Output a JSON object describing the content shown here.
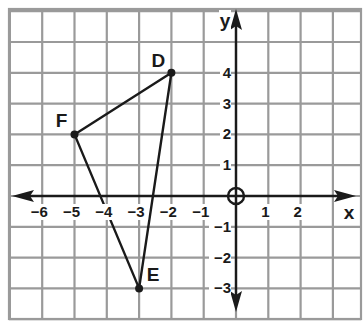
{
  "diagram": {
    "type": "coordinate-plane",
    "axes": {
      "x_label": "x",
      "y_label": "y",
      "x_ticks": [
        {
          "value": -6,
          "label": "−6"
        },
        {
          "value": -5,
          "label": "−5"
        },
        {
          "value": -4,
          "label": "−4"
        },
        {
          "value": -3,
          "label": "−3"
        },
        {
          "value": -2,
          "label": "−2"
        },
        {
          "value": -1,
          "label": "−1"
        },
        {
          "value": 1,
          "label": "1"
        },
        {
          "value": 2,
          "label": "2"
        }
      ],
      "y_ticks": [
        {
          "value": 4,
          "label": "4"
        },
        {
          "value": 3,
          "label": "3"
        },
        {
          "value": 2,
          "label": "2"
        },
        {
          "value": 1,
          "label": "1"
        },
        {
          "value": -1,
          "label": "−1"
        },
        {
          "value": -2,
          "label": "−2"
        },
        {
          "value": -3,
          "label": "−3"
        }
      ],
      "origin_marker": "circle"
    },
    "triangle": {
      "points": [
        {
          "name": "D",
          "x": -2,
          "y": 4
        },
        {
          "name": "E",
          "x": -3,
          "y": -3
        },
        {
          "name": "F",
          "x": -5,
          "y": 2
        }
      ]
    },
    "colors": {
      "grid": "#9a9a9a",
      "axis": "#1a1a1a",
      "shape": "#1a1a1a",
      "background": "#ffffff"
    }
  }
}
